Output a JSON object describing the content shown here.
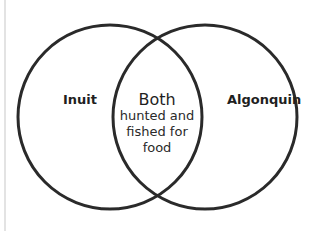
{
  "diagram": {
    "type": "venn",
    "sets": [
      {
        "label": "Inuit"
      },
      {
        "label": "Algonquin"
      }
    ],
    "overlap": {
      "title": "Both",
      "lines": [
        "hunted and",
        "fished for",
        "food"
      ]
    },
    "colors": {
      "stroke": "#2b2b2b",
      "text": "#1f1f1f",
      "background": "#ffffff"
    }
  }
}
